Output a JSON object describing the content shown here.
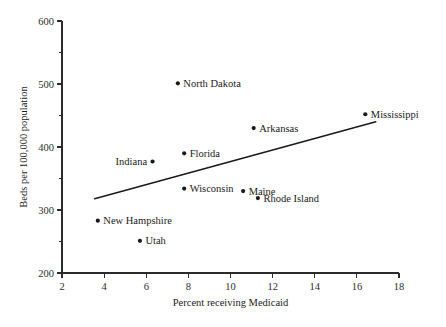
{
  "chart_data": {
    "type": "scatter",
    "title": "",
    "xlabel": "Percent receiving Medicaid",
    "ylabel": "Beds per 100,000 population",
    "xlim": [
      2,
      18
    ],
    "ylim": [
      200,
      600
    ],
    "xticks": [
      2,
      4,
      6,
      8,
      10,
      12,
      14,
      16,
      18
    ],
    "xtick_labels": [
      "2",
      "4",
      "6",
      "8",
      "10",
      "12",
      "14",
      "16",
      "18"
    ],
    "yticks": [
      200,
      300,
      400,
      500,
      600
    ],
    "ytick_labels": [
      "200",
      "300",
      "400",
      "500",
      "600"
    ],
    "yticks_minor": [
      250,
      350,
      450,
      550
    ],
    "grid": false,
    "legend": null,
    "points": [
      {
        "label": "North Dakota",
        "x": 7.5,
        "y": 501,
        "label_side": "right"
      },
      {
        "label": "Mississippi",
        "x": 16.4,
        "y": 452,
        "label_side": "right"
      },
      {
        "label": "Arkansas",
        "x": 11.1,
        "y": 430,
        "label_side": "right"
      },
      {
        "label": "Florida",
        "x": 7.8,
        "y": 390,
        "label_side": "right"
      },
      {
        "label": "Indiana",
        "x": 6.3,
        "y": 377,
        "label_side": "left"
      },
      {
        "label": "Wisconsin",
        "x": 7.8,
        "y": 334,
        "label_side": "right"
      },
      {
        "label": "Maine",
        "x": 10.6,
        "y": 330,
        "label_side": "right"
      },
      {
        "label": "Rhode Island",
        "x": 11.3,
        "y": 319,
        "label_side": "right"
      },
      {
        "label": "New Hampshire",
        "x": 3.7,
        "y": 283,
        "label_side": "right"
      },
      {
        "label": "Utah",
        "x": 5.7,
        "y": 251,
        "label_side": "right"
      }
    ],
    "trend_line": {
      "x_start": 3.55,
      "y_start": 318,
      "x_end": 16.9,
      "y_end": 440
    },
    "colors": {
      "axis": "#2b2b2b",
      "marker": "#1a1a1a",
      "trend_line": "#1a1a1a",
      "background": "#ffffff"
    }
  },
  "caption": {
    "text": ""
  }
}
